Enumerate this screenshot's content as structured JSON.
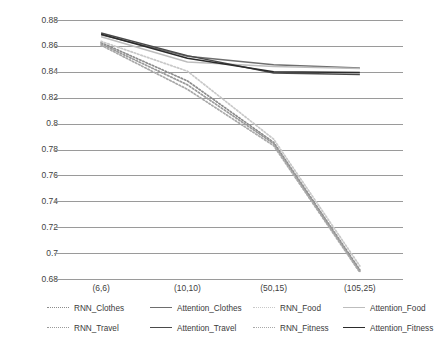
{
  "chart_data": {
    "type": "line",
    "title": "",
    "xlabel": "",
    "ylabel": "",
    "categories": [
      "(6,6)",
      "(10,10)",
      "(50,15)",
      "(105,25)"
    ],
    "ylim": [
      0.68,
      0.88
    ],
    "ytick_labels": [
      "0.88",
      "0.86",
      "0.84",
      "0.82",
      "0.8",
      "0.78",
      "0.76",
      "0.74",
      "0.72",
      "0.7",
      "0.68"
    ],
    "ytick_values": [
      0.88,
      0.86,
      0.84,
      0.82,
      0.8,
      0.78,
      0.76,
      0.74,
      0.72,
      0.7,
      0.68
    ],
    "grid": true,
    "legend_position": "bottom",
    "series": [
      {
        "name": "RNN_Clothes",
        "style": "dotted",
        "color": "#8c8c8c",
        "values": [
          0.8625,
          0.833,
          0.7855,
          0.687
        ]
      },
      {
        "name": "Attention_Clothes",
        "style": "solid",
        "color": "#6e6e6e",
        "values": [
          0.8685,
          0.852,
          0.8455,
          0.843
        ]
      },
      {
        "name": "RNN_Food",
        "style": "dotted",
        "color": "#c8c8c8",
        "values": [
          0.8635,
          0.8405,
          0.788,
          0.69
        ]
      },
      {
        "name": "Attention_Food",
        "style": "solid",
        "color": "#bdbdbd",
        "values": [
          0.867,
          0.8475,
          0.844,
          0.8425
        ]
      },
      {
        "name": "RNN_Travel",
        "style": "dotted",
        "color": "#9a9a9a",
        "values": [
          0.8615,
          0.83,
          0.7845,
          0.686
        ]
      },
      {
        "name": "Attention_Travel",
        "style": "solid",
        "color": "#4a4a4a",
        "values": [
          0.87,
          0.8525,
          0.839,
          0.838
        ]
      },
      {
        "name": "RNN_Fitness",
        "style": "dotted",
        "color": "#a8a8a8",
        "values": [
          0.8605,
          0.8265,
          0.783,
          0.685
        ]
      },
      {
        "name": "Attention_Fitness",
        "style": "solid",
        "color": "#2b2b2b",
        "values": [
          0.869,
          0.8505,
          0.84,
          0.8395
        ]
      }
    ]
  },
  "legend": {
    "entries": [
      {
        "label": "RNN_Clothes"
      },
      {
        "label": "Attention_Clothes"
      },
      {
        "label": "RNN_Food"
      },
      {
        "label": "Attention_Food"
      },
      {
        "label": "RNN_Travel"
      },
      {
        "label": "Attention_Travel"
      },
      {
        "label": "RNN_Fitness"
      },
      {
        "label": "Attention_Fitness"
      }
    ]
  }
}
